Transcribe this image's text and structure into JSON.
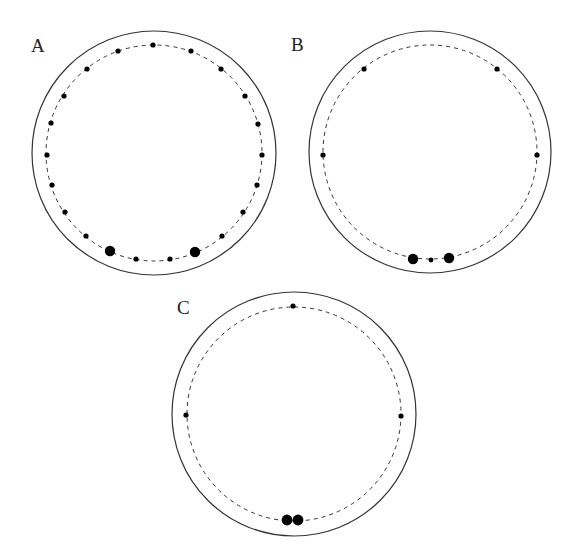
{
  "figure": {
    "width": 579,
    "height": 559,
    "colors": {
      "background": "#ffffff",
      "stroke": "#333333",
      "dot": "#000000"
    },
    "panels": [
      {
        "label": "A",
        "label_pos": {
          "x": 31,
          "y": 52
        },
        "center": {
          "x": 154,
          "y": 153
        },
        "outer_radius": 122,
        "dashed_radius": 108,
        "dots": [
          {
            "x": 153,
            "y": 45,
            "r": 2.6
          },
          {
            "x": 118,
            "y": 51,
            "r": 2.6
          },
          {
            "x": 191,
            "y": 51,
            "r": 2.6
          },
          {
            "x": 87,
            "y": 69,
            "r": 2.6
          },
          {
            "x": 221,
            "y": 69,
            "r": 2.6
          },
          {
            "x": 64,
            "y": 96,
            "r": 2.6
          },
          {
            "x": 245,
            "y": 96,
            "r": 2.6
          },
          {
            "x": 51,
            "y": 123,
            "r": 2.6
          },
          {
            "x": 258,
            "y": 124,
            "r": 2.6
          },
          {
            "x": 47,
            "y": 155,
            "r": 2.6
          },
          {
            "x": 262,
            "y": 155,
            "r": 2.6
          },
          {
            "x": 52,
            "y": 185,
            "r": 2.6
          },
          {
            "x": 257,
            "y": 185,
            "r": 2.6
          },
          {
            "x": 65,
            "y": 212,
            "r": 2.6
          },
          {
            "x": 243,
            "y": 212,
            "r": 2.6
          },
          {
            "x": 86,
            "y": 236,
            "r": 2.6
          },
          {
            "x": 222,
            "y": 236,
            "r": 2.6
          },
          {
            "x": 110,
            "y": 251,
            "r": 5.2
          },
          {
            "x": 195,
            "y": 252,
            "r": 5.2
          },
          {
            "x": 136,
            "y": 259,
            "r": 2.6
          },
          {
            "x": 170,
            "y": 259,
            "r": 2.6
          }
        ]
      },
      {
        "label": "B",
        "label_pos": {
          "x": 291,
          "y": 51
        },
        "center": {
          "x": 430,
          "y": 152
        },
        "outer_radius": 121,
        "dashed_radius": 107,
        "dots": [
          {
            "x": 364,
            "y": 69,
            "r": 2.6
          },
          {
            "x": 497,
            "y": 69,
            "r": 2.6
          },
          {
            "x": 323,
            "y": 155,
            "r": 2.6
          },
          {
            "x": 537,
            "y": 155,
            "r": 2.6
          },
          {
            "x": 413,
            "y": 259,
            "r": 5.2
          },
          {
            "x": 431,
            "y": 260,
            "r": 2.4
          },
          {
            "x": 449,
            "y": 258,
            "r": 5.2
          }
        ]
      },
      {
        "label": "C",
        "label_pos": {
          "x": 177,
          "y": 314
        },
        "center": {
          "x": 294,
          "y": 414
        },
        "outer_radius": 122,
        "dashed_radius": 107,
        "dots": [
          {
            "x": 293,
            "y": 306,
            "r": 2.6
          },
          {
            "x": 186,
            "y": 415,
            "r": 2.6
          },
          {
            "x": 401,
            "y": 416,
            "r": 2.6
          },
          {
            "x": 287,
            "y": 520,
            "r": 5.4
          },
          {
            "x": 298,
            "y": 520,
            "r": 5.4
          }
        ]
      }
    ]
  }
}
